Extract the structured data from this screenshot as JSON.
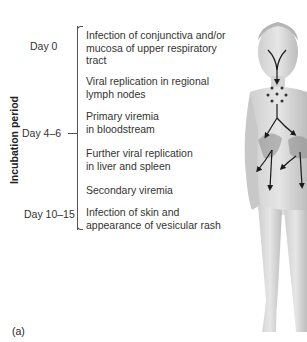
{
  "axis": {
    "label": "Incubation period"
  },
  "days": [
    {
      "label": "Day 0"
    },
    {
      "label": "Day 4–6"
    },
    {
      "label": "Day 10–15"
    }
  ],
  "steps": [
    {
      "text": "Infection of conjunctiva and/or mucosa of upper respiratory tract"
    },
    {
      "text": "Viral replication in regional lymph nodes"
    },
    {
      "text": "Primary viremia in bloodstream"
    },
    {
      "text": "Further viral replication in liver and spleen"
    },
    {
      "text": "Secondary viremia"
    },
    {
      "text": "Infection of skin and appearance of vesicular  rash"
    }
  ],
  "panel_label": "(a)",
  "illustration": {
    "subject": "child-body-figure",
    "arrow_color": "#1a1a1a",
    "dot_color": "#333333"
  }
}
